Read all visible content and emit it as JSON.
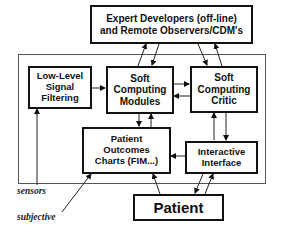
{
  "diagram": {
    "nodes": {
      "expert": {
        "label": "Expert Developers (off-line)\nand Remote Observers/CDM's"
      },
      "filter": {
        "label": "Low-Level\nSignal\nFiltering"
      },
      "modules": {
        "label": "Soft\nComputing\nModules"
      },
      "critic": {
        "label": "Soft\nComputing\nCritic"
      },
      "outcomes": {
        "label": "Patient\nOutcomes\nCharts (FIM...)"
      },
      "interface": {
        "label": "Interactive\nInterface"
      },
      "patient": {
        "label": "Patient"
      }
    },
    "inputs": {
      "sensors": "sensors",
      "subjective": "subjective"
    },
    "edges": [
      {
        "from": "filter",
        "to": "modules"
      },
      {
        "from": "modules",
        "to": "critic"
      },
      {
        "from": "critic",
        "to": "modules"
      },
      {
        "from": "modules",
        "to": "expert"
      },
      {
        "from": "expert",
        "to": "modules"
      },
      {
        "from": "expert",
        "to": "critic"
      },
      {
        "from": "critic",
        "to": "expert"
      },
      {
        "from": "modules",
        "to": "outcomes"
      },
      {
        "from": "outcomes",
        "to": "modules"
      },
      {
        "from": "critic",
        "to": "interface"
      },
      {
        "from": "interface",
        "to": "critic"
      },
      {
        "from": "interface",
        "to": "outcomes"
      },
      {
        "from": "patient",
        "to": "outcomes"
      },
      {
        "from": "interface",
        "to": "patient"
      },
      {
        "from": "patient",
        "to": "interface"
      },
      {
        "from": "sensors",
        "to": "filter"
      },
      {
        "from": "subjective",
        "to": "outcomes"
      }
    ]
  }
}
